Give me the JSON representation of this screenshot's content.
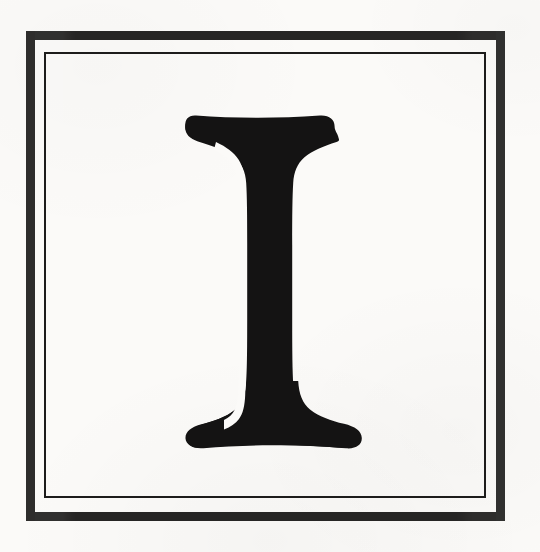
{
  "artwork": {
    "kind": "decorative-initial",
    "letter": "I",
    "caption_text": "I",
    "style": "serif-didone-drop-cap",
    "background_color": "#fbfaf8",
    "ink_color": "#141313"
  },
  "frame": {
    "type": "double-rule-square",
    "outer": {
      "color": "#191817",
      "stroke_px": 9,
      "x": 26,
      "y": 31,
      "width": 479,
      "height": 490
    },
    "inner": {
      "color": "#1d1c1b",
      "stroke_px": 2,
      "x": 44,
      "y": 52,
      "width": 442,
      "height": 446
    }
  },
  "glyph": {
    "character": "I",
    "color": "#141313",
    "highlight_color": "#fbfaf8",
    "bounds": {
      "x": 185,
      "y": 114,
      "width": 167,
      "height": 323
    },
    "top_serif": {
      "left": 185,
      "right": 330,
      "top": 114
    },
    "bottom_serif": {
      "left": 200,
      "right": 352,
      "bottom": 437
    },
    "stem": {
      "left": 239,
      "right": 296
    },
    "highlight_channel": {
      "left": 248,
      "right": 257
    }
  },
  "canvas": {
    "width": 540,
    "height": 552
  }
}
